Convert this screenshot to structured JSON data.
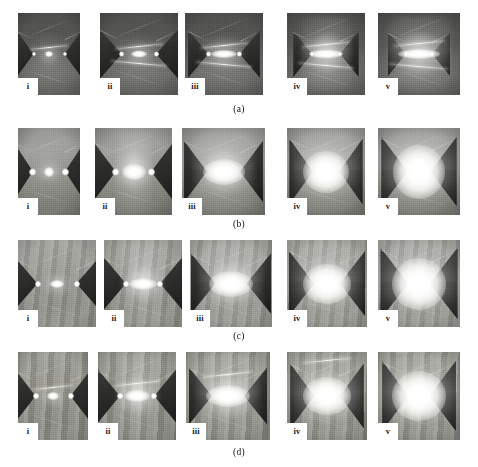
{
  "figure": {
    "type": "photo-grid",
    "columns": 5,
    "rows": 4,
    "column_labels": [
      "i",
      "ii",
      "iii",
      "iv",
      "v"
    ],
    "row_captions": [
      "(a)",
      "(b)",
      "(c)",
      "(d)"
    ]
  },
  "rows": [
    {
      "caption": "(a)",
      "caption_y": 104,
      "background": "bg-a",
      "top": 13,
      "height": 82,
      "panels": [
        {
          "label": "i",
          "x": 18,
          "w": 62,
          "h": 82,
          "arc_w": 8,
          "arc_h": 6,
          "halo": 22,
          "tipsep": 0.5,
          "elec_w": 0.3,
          "elec_h": 0.62,
          "spot": 4,
          "plume": 0,
          "rods": 1,
          "style": "thin"
        },
        {
          "label": "ii",
          "x": 100,
          "w": 78,
          "h": 82,
          "arc_w": 16,
          "arc_h": 7,
          "halo": 34,
          "tipsep": 0.44,
          "elec_w": 0.28,
          "elec_h": 0.6,
          "spot": 5,
          "plume": 0,
          "rods": 2,
          "style": "thin"
        },
        {
          "label": "iii",
          "x": 185,
          "w": 78,
          "h": 82,
          "arc_w": 26,
          "arc_h": 8,
          "halo": 44,
          "tipsep": 0.4,
          "elec_w": 0.26,
          "elec_h": 0.58,
          "spot": 5,
          "plume": 0,
          "rods": 2,
          "style": "thin"
        },
        {
          "label": "iv",
          "x": 287,
          "w": 78,
          "h": 82,
          "arc_w": 34,
          "arc_h": 9,
          "halo": 52,
          "tipsep": 0.36,
          "elec_w": 0.24,
          "elec_h": 0.56,
          "spot": 4,
          "plume": 1,
          "rods": 2,
          "style": "thin"
        },
        {
          "label": "v",
          "x": 378,
          "w": 82,
          "h": 82,
          "arc_w": 42,
          "arc_h": 10,
          "halo": 60,
          "tipsep": 0.32,
          "elec_w": 0.22,
          "elec_h": 0.54,
          "spot": 4,
          "plume": 1,
          "rods": 2,
          "style": "thin"
        }
      ]
    },
    {
      "caption": "(b)",
      "caption_y": 219,
      "background": "bg-b",
      "top": 128,
      "height": 87,
      "panels": [
        {
          "label": "i",
          "x": 18,
          "w": 62,
          "h": 87,
          "arc_w": 10,
          "arc_h": 10,
          "halo": 26,
          "tipsep": 0.52,
          "elec_w": 0.32,
          "elec_h": 0.7,
          "spot": 7,
          "plume": 0,
          "rods": 0,
          "style": "wedge"
        },
        {
          "label": "ii",
          "x": 95,
          "w": 77,
          "h": 87,
          "arc_w": 24,
          "arc_h": 16,
          "halo": 44,
          "tipsep": 0.46,
          "elec_w": 0.3,
          "elec_h": 0.7,
          "spot": 7,
          "plume": 1,
          "rods": 0,
          "style": "wedge"
        },
        {
          "label": "iii",
          "x": 182,
          "w": 83,
          "h": 87,
          "arc_w": 42,
          "arc_h": 26,
          "halo": 62,
          "tipsep": 0.4,
          "elec_w": 0.28,
          "elec_h": 0.72,
          "spot": 0,
          "plume": 1,
          "rods": 0,
          "style": "wedge"
        },
        {
          "label": "iv",
          "x": 287,
          "w": 78,
          "h": 87,
          "arc_w": 46,
          "arc_h": 42,
          "halo": 70,
          "tipsep": 0.34,
          "elec_w": 0.3,
          "elec_h": 0.76,
          "spot": 0,
          "plume": 1,
          "rods": 0,
          "style": "wedge"
        },
        {
          "label": "v",
          "x": 378,
          "w": 82,
          "h": 87,
          "arc_w": 52,
          "arc_h": 54,
          "halo": 80,
          "tipsep": 0.28,
          "elec_w": 0.32,
          "elec_h": 0.8,
          "spot": 0,
          "plume": 1,
          "rods": 0,
          "style": "wedge"
        }
      ]
    },
    {
      "caption": "(c)",
      "caption_y": 331,
      "background": "bg-c",
      "top": 240,
      "height": 87,
      "panels": [
        {
          "label": "i",
          "x": 18,
          "w": 78,
          "h": 87,
          "arc_w": 14,
          "arc_h": 8,
          "halo": 28,
          "tipsep": 0.5,
          "elec_w": 0.3,
          "elec_h": 0.62,
          "spot": 6,
          "plume": 0,
          "rods": 0,
          "style": "wedge"
        },
        {
          "label": "ii",
          "x": 104,
          "w": 78,
          "h": 87,
          "arc_w": 28,
          "arc_h": 12,
          "halo": 44,
          "tipsep": 0.44,
          "elec_w": 0.3,
          "elec_h": 0.64,
          "spot": 6,
          "plume": 1,
          "rods": 0,
          "style": "wedge"
        },
        {
          "label": "iii",
          "x": 190,
          "w": 82,
          "h": 87,
          "arc_w": 44,
          "arc_h": 26,
          "halo": 62,
          "tipsep": 0.38,
          "elec_w": 0.3,
          "elec_h": 0.7,
          "spot": 0,
          "plume": 1,
          "rods": 0,
          "style": "wedge"
        },
        {
          "label": "iv",
          "x": 287,
          "w": 80,
          "h": 87,
          "arc_w": 48,
          "arc_h": 40,
          "halo": 70,
          "tipsep": 0.32,
          "elec_w": 0.32,
          "elec_h": 0.76,
          "spot": 0,
          "plume": 1,
          "rods": 0,
          "style": "wedge"
        },
        {
          "label": "v",
          "x": 378,
          "w": 82,
          "h": 87,
          "arc_w": 54,
          "arc_h": 52,
          "halo": 80,
          "tipsep": 0.26,
          "elec_w": 0.34,
          "elec_h": 0.82,
          "spot": 0,
          "plume": 1,
          "rods": 0,
          "style": "wedge"
        }
      ]
    },
    {
      "caption": "(d)",
      "caption_y": 447,
      "background": "bg-d",
      "top": 352,
      "height": 88,
      "panels": [
        {
          "label": "i",
          "x": 18,
          "w": 70,
          "h": 88,
          "arc_w": 12,
          "arc_h": 8,
          "halo": 26,
          "tipsep": 0.5,
          "elec_w": 0.28,
          "elec_h": 0.58,
          "spot": 6,
          "plume": 0,
          "rods": 1,
          "style": "wedge"
        },
        {
          "label": "ii",
          "x": 98,
          "w": 78,
          "h": 88,
          "arc_w": 26,
          "arc_h": 12,
          "halo": 46,
          "tipsep": 0.44,
          "elec_w": 0.28,
          "elec_h": 0.6,
          "spot": 6,
          "plume": 1,
          "rods": 1,
          "style": "wedge"
        },
        {
          "label": "iii",
          "x": 186,
          "w": 84,
          "h": 88,
          "arc_w": 44,
          "arc_h": 22,
          "halo": 62,
          "tipsep": 0.38,
          "elec_w": 0.28,
          "elec_h": 0.66,
          "spot": 0,
          "plume": 1,
          "rods": 1,
          "style": "wedge"
        },
        {
          "label": "iv",
          "x": 287,
          "w": 80,
          "h": 88,
          "arc_w": 48,
          "arc_h": 38,
          "halo": 72,
          "tipsep": 0.32,
          "elec_w": 0.3,
          "elec_h": 0.74,
          "spot": 0,
          "plume": 1,
          "rods": 1,
          "style": "wedge"
        },
        {
          "label": "v",
          "x": 378,
          "w": 82,
          "h": 88,
          "arc_w": 54,
          "arc_h": 50,
          "halo": 80,
          "tipsep": 0.26,
          "elec_w": 0.32,
          "elec_h": 0.8,
          "spot": 0,
          "plume": 1,
          "rods": 1,
          "style": "wedge"
        }
      ]
    }
  ],
  "colors": {
    "page_background": "#ffffff",
    "label_background": "#ffffff",
    "label_text": "#1a1a1a",
    "caption_text": "#111111",
    "electrode_dark": "#1d1d1c",
    "arc_core": "#ffffff"
  },
  "label_box": {
    "width": 20,
    "height": 17
  }
}
